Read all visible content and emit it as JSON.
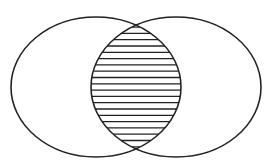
{
  "diagram": {
    "type": "venn",
    "background": "#ffffff",
    "stroke_color": "#222222",
    "stroke_width": 1.6,
    "hatch_color": "#222222",
    "hatch_spacing": 6.3,
    "hatch_width": 1.3,
    "sets": [
      {
        "name": "left-set",
        "cx": 96,
        "cy": 87,
        "rx": 85,
        "ry": 70
      },
      {
        "name": "right-set",
        "cx": 176,
        "cy": 87,
        "rx": 85,
        "ry": 70
      }
    ],
    "intersection": {
      "shaded": true,
      "pattern": "horizontal-lines"
    },
    "labels": []
  }
}
